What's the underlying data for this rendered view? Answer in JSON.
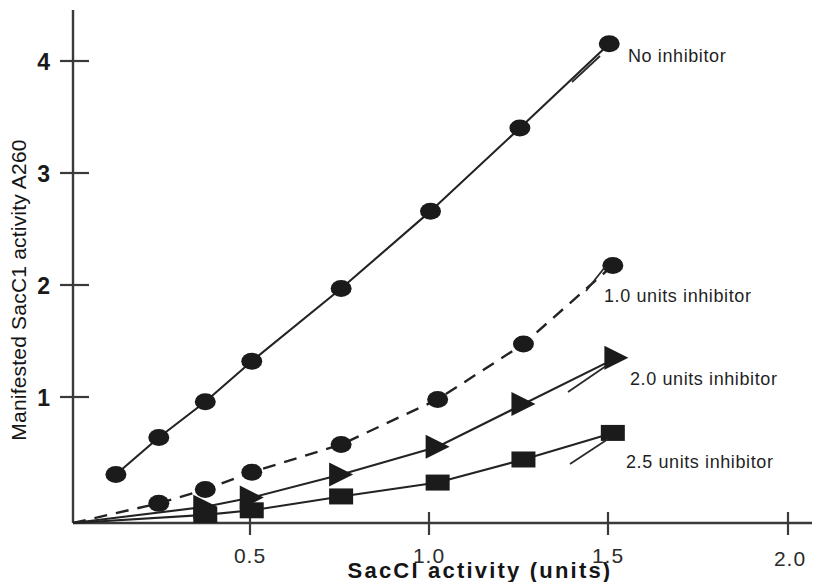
{
  "chart_data": {
    "type": "line",
    "title": "",
    "xlabel": "SacCI activity  (units)",
    "ylabel": "Manifested SacC1 activity A260",
    "xlim": [
      0,
      2.0
    ],
    "ylim": [
      0,
      4.45
    ],
    "grid": false,
    "legend_position": "right-inline-annotations",
    "xticks": [
      "0.5",
      "1.0",
      "1.5",
      "2.0"
    ],
    "xtick_values": [
      0.5,
      1.0,
      1.5,
      2.0
    ],
    "yticks": [
      "1",
      "2",
      "3",
      "4"
    ],
    "ytick_values": [
      1,
      2,
      3,
      4
    ],
    "series": [
      {
        "name": "No inhibitor",
        "marker": "circle",
        "line_style": "solid",
        "x": [
          0.12,
          0.24,
          0.37,
          0.5,
          0.75,
          1.0,
          1.25,
          1.5
        ],
        "values": [
          0.42,
          0.74,
          1.05,
          1.4,
          2.03,
          2.7,
          3.42,
          4.15
        ]
      },
      {
        "name": "1.0  units inhibitor",
        "marker": "circle",
        "line_style": "dashed",
        "x": [
          0.0,
          0.24,
          0.37,
          0.5,
          0.75,
          1.02,
          1.26,
          1.51
        ],
        "values": [
          0.0,
          0.17,
          0.29,
          0.44,
          0.68,
          1.07,
          1.55,
          2.23
        ]
      },
      {
        "name": "2.0 units inhibitor",
        "marker": "triangle",
        "line_style": "solid",
        "x": [
          0.0,
          0.37,
          0.5,
          0.75,
          1.02,
          1.26,
          1.52
        ],
        "values": [
          0.0,
          0.14,
          0.22,
          0.42,
          0.66,
          1.03,
          1.43
        ]
      },
      {
        "name": "2.5 units inhibitor",
        "marker": "square",
        "line_style": "solid",
        "x": [
          0.0,
          0.37,
          0.5,
          0.75,
          1.02,
          1.26,
          1.51
        ],
        "values": [
          0.0,
          0.07,
          0.11,
          0.23,
          0.35,
          0.55,
          0.78
        ]
      }
    ]
  },
  "axes": {
    "x_title": "SacCI activity  (units)",
    "y_title": "Manifested SacC1 activity A260",
    "x_tick_labels": [
      "0.5",
      "1.0",
      "1.5",
      "2.0"
    ],
    "y_tick_labels": [
      "1",
      "2",
      "3",
      "4"
    ]
  },
  "annotations": {
    "no_inhibitor": "No inhibitor",
    "inhibitor_1_0": "1.0  units inhibitor",
    "inhibitor_2_0": "2.0 units inhibitor",
    "inhibitor_2_5": "2.5 units inhibitor"
  },
  "colors": {
    "ink": "#1b1b1b",
    "axis": "#3a3a3a",
    "background": "#ffffff"
  }
}
